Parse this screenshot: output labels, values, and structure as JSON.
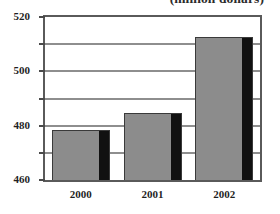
{
  "chart_data": {
    "type": "bar",
    "title": "(million dollars)",
    "xlabel": "",
    "ylabel": "",
    "categories": [
      "2000",
      "2001",
      "2002"
    ],
    "values": [
      437,
      449,
      505
    ],
    "ylim": [
      400,
      520
    ],
    "yticks": [
      400,
      420,
      440,
      460,
      480,
      500,
      520
    ],
    "ytick_labels": [
      "400",
      "420",
      "440",
      "460",
      "480",
      "500",
      "520"
    ],
    "grid": true,
    "legend": false,
    "colors": {
      "bar_fill": "#8c8c8c",
      "bar_outline": "#3a3a3a",
      "bar_shadow": "#111111",
      "gridline": "#8e8e8e",
      "frame": "#5a5a5a",
      "plot_background": "#ffffff",
      "text": "#1f1f1f"
    }
  }
}
